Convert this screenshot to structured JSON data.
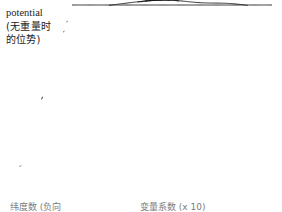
{
  "figure": {
    "background_color": "#ffffff",
    "ink_color": "#101010",
    "label": {
      "line1": "potential",
      "line2": "(无重量时",
      "line3": "的位势)"
    },
    "captions": {
      "left": "纬度数 (负向",
      "right": "变量系数 (x 10)"
    }
  },
  "chart_data": {
    "type": "surface",
    "render_style": "hidden-line wireframe mesh",
    "xlabel": "纬度数 (负向",
    "ylabel": "变量系数 (x 10)",
    "zlabel": "potential",
    "projection": {
      "domain_shape": "parallelogram",
      "corner_back_left": [
        72,
        5
      ],
      "corner_back_right": [
        272,
        5
      ],
      "corner_front_right": [
        215,
        197
      ],
      "corner_front_left": [
        10,
        197
      ],
      "row_count": 58,
      "col_samples": 190,
      "z_scale_px": 78
    },
    "axis_ranges": {
      "x": [
        0,
        1
      ],
      "y": [
        0,
        1
      ],
      "z": [
        0,
        1
      ]
    },
    "grid": false,
    "legend": false,
    "surface_features": [
      {
        "name": "main-peak",
        "kind": "gaussian-bump",
        "center_u": 0.46,
        "center_v": 0.44,
        "amplitude": 1.0,
        "sigma_u": 0.2,
        "sigma_v": 0.24
      },
      {
        "name": "secondary-ridge",
        "kind": "gaussian-bump",
        "center_u": 0.8,
        "center_v": 0.52,
        "amplitude": 0.46,
        "sigma_u": 0.13,
        "sigma_v": 0.3
      },
      {
        "name": "saddle-dip",
        "kind": "gaussian-well",
        "center_u": 0.655,
        "center_v": 0.3,
        "amplitude": -0.3,
        "sigma_u": 0.085,
        "sigma_v": 0.16
      },
      {
        "name": "left-foot-shoulder",
        "kind": "gaussian-bump",
        "center_u": 0.17,
        "center_v": 0.66,
        "amplitude": 0.16,
        "sigma_u": 0.15,
        "sigma_v": 0.22
      },
      {
        "name": "back-rim",
        "kind": "gaussian-bump",
        "center_u": 0.52,
        "center_v": 0.07,
        "amplitude": 0.1,
        "sigma_u": 0.3,
        "sigma_v": 0.09
      }
    ],
    "shading": {
      "flat_region_tone": "#8d8d8d",
      "lit_region_tone": "#ffffff",
      "line_width_px": 0.85
    }
  }
}
